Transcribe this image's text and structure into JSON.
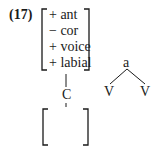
{
  "example": {
    "number": "(17)",
    "feature_matrix": [
      "+ ant",
      "− cor",
      "+ voice",
      "+ labial"
    ],
    "root_node": "C",
    "empty_matrix": ""
  },
  "tree": {
    "top": "a",
    "leaves": [
      "V",
      "V"
    ]
  }
}
